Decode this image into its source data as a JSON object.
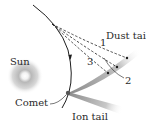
{
  "diagram": {
    "labels": {
      "sun": "Sun",
      "comet": "Comet",
      "dust_tail": "Dust tail",
      "ion_tail": "Ion tail",
      "path_1": "1",
      "path_2": "2",
      "path_3": "3"
    },
    "colors": {
      "orbit": "#1e1e1e",
      "sun_glow": "#9a9a9a",
      "tail": "#b0b0b0",
      "text": "#2a2a2a"
    }
  }
}
